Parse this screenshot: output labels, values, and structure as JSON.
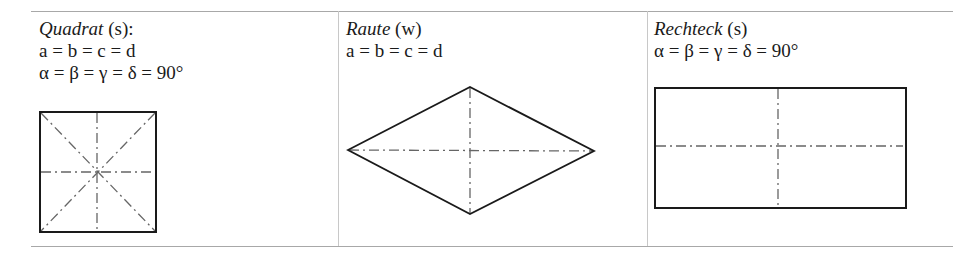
{
  "table": {
    "columns": [
      {
        "name_italic": "Quadrat",
        "name_suffix": " (s):",
        "lines": [
          "a = b = c = d",
          "α = β = γ = δ = 90°"
        ],
        "shape": "square"
      },
      {
        "name_italic": "Raute",
        "name_suffix": " (w)",
        "lines": [
          "a = b = c = d"
        ],
        "shape": "rhombus"
      },
      {
        "name_italic": "Rechteck",
        "name_suffix": " (s)",
        "lines": [
          "α = β = γ = δ = 90°"
        ],
        "shape": "rectangle"
      }
    ]
  },
  "colors": {
    "outline": "#1a1a1a",
    "axis": "#555555",
    "rule": "#a8a8a8"
  }
}
